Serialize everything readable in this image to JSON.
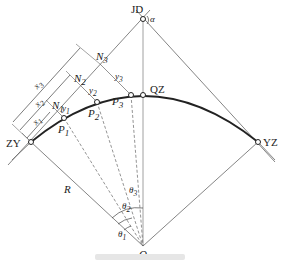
{
  "diagram": {
    "type": "circular-curve-offset-layout",
    "points": {
      "JD": {
        "label": "JD",
        "x": 143,
        "y": 19
      },
      "QZ": {
        "label": "QZ",
        "x": 143,
        "y": 95
      },
      "ZY": {
        "label": "ZY",
        "x": 31,
        "y": 142
      },
      "YZ": {
        "label": "YZ",
        "x": 258,
        "y": 142
      },
      "O": {
        "label": "O",
        "x": 143,
        "y": 246
      },
      "P1": {
        "label": "P",
        "sub": "1",
        "x": 64,
        "y": 118
      },
      "P2": {
        "label": "P",
        "sub": "2",
        "x": 97,
        "y": 102
      },
      "P3": {
        "label": "P",
        "sub": "3",
        "x": 131,
        "y": 95
      }
    },
    "labels": {
      "alpha": "α",
      "R": "R",
      "N": "N",
      "x": "x",
      "y": "y",
      "theta": "θ",
      "s1": "1",
      "s2": "2",
      "s3": "3"
    },
    "colors": {
      "line": "#555555",
      "curve": "#222222",
      "text": "#222222"
    }
  }
}
